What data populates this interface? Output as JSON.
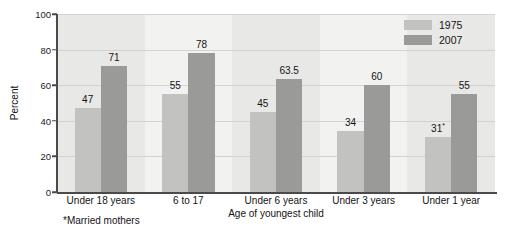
{
  "chart_data": {
    "type": "bar",
    "title": "",
    "xlabel": "Age of youngest child",
    "ylabel": "Percent",
    "ylim": [
      0,
      100
    ],
    "yticks": [
      0,
      20,
      40,
      60,
      80,
      100
    ],
    "ytick_labels": [
      "0",
      "20",
      "40",
      "60",
      "80",
      "100"
    ],
    "grid": true,
    "legend_position": "top-right",
    "categories": [
      "Under 18 years",
      "6 to 17",
      "Under 6 years",
      "Under 3 years",
      "Under 1 year"
    ],
    "series": [
      {
        "name": "1975",
        "color": "#c2c2c0",
        "values": [
          47,
          55,
          45,
          34,
          31
        ],
        "value_labels": [
          "47",
          "55",
          "45",
          "34",
          "31"
        ],
        "value_label_marks": [
          "",
          "",
          "",
          "",
          "*"
        ]
      },
      {
        "name": "2007",
        "color": "#9a9a98",
        "values": [
          71,
          78,
          63.5,
          60,
          55
        ],
        "value_labels": [
          "71",
          "78",
          "63.5",
          "60",
          "55"
        ],
        "value_label_marks": [
          "",
          "",
          "",
          "",
          ""
        ]
      }
    ],
    "annotations": [
      {
        "text": "*Married mothers"
      }
    ]
  },
  "footnote": "*Married mothers"
}
